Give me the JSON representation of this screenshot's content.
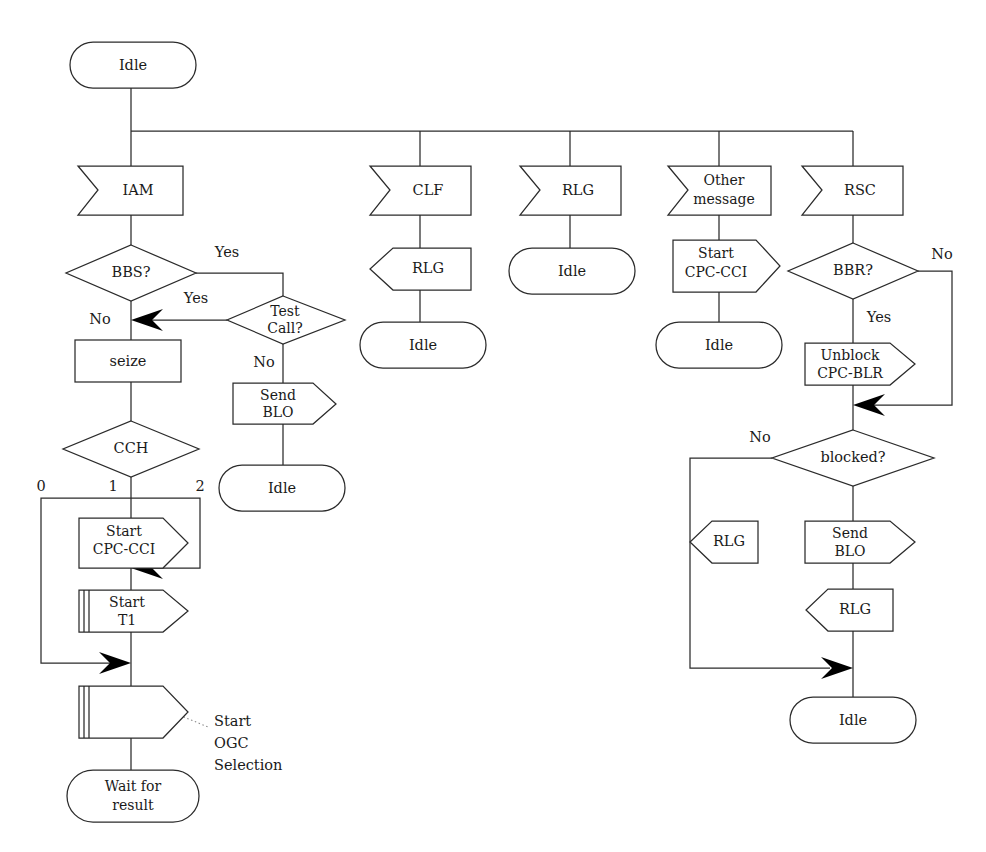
{
  "diagram": {
    "background_color": "#ffffff",
    "line_color": "#2b2b2b",
    "text_color": "#1a1a1a",
    "callout_color": "#8a8a8a"
  },
  "nodes": {
    "start_idle": {
      "label": "Idle",
      "shape": "state"
    },
    "iam": {
      "label": "IAM",
      "shape": "message-in"
    },
    "bbs": {
      "label": "BBS?",
      "shape": "decision"
    },
    "test_call": {
      "label": "Test\nCall?",
      "line1": "Test",
      "line2": "Call?",
      "shape": "decision"
    },
    "seize": {
      "label": "seize",
      "shape": "process"
    },
    "send_blo_left": {
      "line1": "Send",
      "line2": "BLO",
      "shape": "message-out"
    },
    "idle_blo_left": {
      "label": "Idle",
      "shape": "state"
    },
    "cch": {
      "label": "CCH",
      "shape": "decision"
    },
    "start_cpc_cci_cch": {
      "line1": "Start",
      "line2": "CPC-CCI",
      "shape": "message-out"
    },
    "start_t1": {
      "line1": "Start",
      "line2": "T1",
      "shape": "procedure-out"
    },
    "ogc_shape": {
      "label": "",
      "shape": "procedure-out"
    },
    "wait_for_result": {
      "line1": "Wait for",
      "line2": "result",
      "shape": "state"
    },
    "clf": {
      "label": "CLF",
      "shape": "message-in"
    },
    "rlg_clf": {
      "label": "RLG",
      "shape": "message-out-left"
    },
    "idle_clf": {
      "label": "Idle",
      "shape": "state"
    },
    "rlg_top": {
      "label": "RLG",
      "shape": "message-in"
    },
    "idle_rlg": {
      "label": "Idle",
      "shape": "state"
    },
    "other_message": {
      "line1": "Other",
      "line2": "message",
      "shape": "message-in"
    },
    "start_cpc_cci_om": {
      "line1": "Start",
      "line2": "CPC-CCI",
      "shape": "message-out"
    },
    "idle_om": {
      "label": "Idle",
      "shape": "state"
    },
    "rsc": {
      "label": "RSC",
      "shape": "message-in"
    },
    "bbr": {
      "label": "BBR?",
      "shape": "decision"
    },
    "unblock": {
      "line1": "Unblock",
      "line2": "CPC-BLR",
      "shape": "message-out"
    },
    "blocked": {
      "label": "blocked?",
      "shape": "decision"
    },
    "rlg_notblocked": {
      "label": "RLG",
      "shape": "message-out-left"
    },
    "send_blo_right": {
      "line1": "Send",
      "line2": "BLO",
      "shape": "message-out"
    },
    "rlg_blocked": {
      "label": "RLG",
      "shape": "message-out-left"
    },
    "idle_rsc": {
      "label": "Idle",
      "shape": "state"
    }
  },
  "edge_labels": {
    "bbs_yes_top": "Yes",
    "bbs_no": "No",
    "testcall_yes": "Yes",
    "testcall_no": "No",
    "cch_0": "0",
    "cch_1": "1",
    "cch_2": "2",
    "bbr_no": "No",
    "bbr_yes": "Yes",
    "blocked_no": "No"
  },
  "annotations": {
    "ogc_note": {
      "line1": "Start",
      "line2": "OGC",
      "line3": "Selection"
    }
  }
}
